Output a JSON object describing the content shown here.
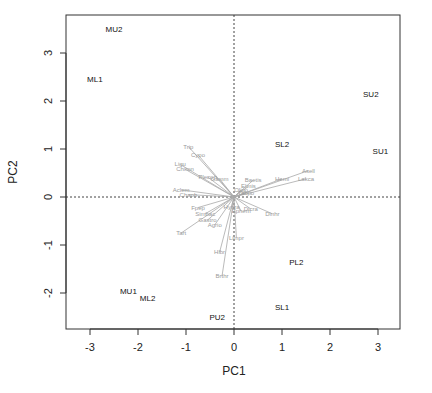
{
  "chart_data": {
    "type": "scatter",
    "subtype": "pca-biplot",
    "title": "",
    "xlabel": "PC1",
    "ylabel": "PC2",
    "xlim": [
      -3.5,
      3.45
    ],
    "ylim": [
      -2.75,
      3.8
    ],
    "xticks": [
      -3,
      -2,
      -1,
      0,
      1,
      2,
      3
    ],
    "yticks": [
      -2,
      -1,
      0,
      1,
      2,
      3
    ],
    "grid": false,
    "reference_lines": {
      "x": 0,
      "y": 0,
      "style": "dotted"
    },
    "observations": [
      {
        "label": "MU2",
        "x": -2.5,
        "y": 3.5
      },
      {
        "label": "ML1",
        "x": -2.9,
        "y": 2.45
      },
      {
        "label": "SU2",
        "x": 2.85,
        "y": 2.15
      },
      {
        "label": "SL2",
        "x": 1.0,
        "y": 1.1
      },
      {
        "label": "SU1",
        "x": 3.05,
        "y": 0.95
      },
      {
        "label": "PL2",
        "x": 1.3,
        "y": -1.35
      },
      {
        "label": "MU1",
        "x": -2.2,
        "y": -1.95
      },
      {
        "label": "ML2",
        "x": -1.8,
        "y": -2.1
      },
      {
        "label": "SL1",
        "x": 1.0,
        "y": -2.3
      },
      {
        "label": "PU2",
        "x": -0.35,
        "y": -2.5
      }
    ],
    "variables": [
      {
        "label": "Trip",
        "x": -0.95,
        "y": 1.05
      },
      {
        "label": "Cypo",
        "x": -0.75,
        "y": 0.88
      },
      {
        "label": "Ligu",
        "x": -1.12,
        "y": 0.68
      },
      {
        "label": "Chiron",
        "x": -1.02,
        "y": 0.58
      },
      {
        "label": "Plecop",
        "x": -0.55,
        "y": 0.42
      },
      {
        "label": "Gamm",
        "x": -0.3,
        "y": 0.38
      },
      {
        "label": "Aclem",
        "x": -1.1,
        "y": 0.15
      },
      {
        "label": "Chaob",
        "x": -0.95,
        "y": 0.05
      },
      {
        "label": "Asell",
        "x": 1.55,
        "y": 0.55
      },
      {
        "label": "Hemi",
        "x": 1.0,
        "y": 0.38
      },
      {
        "label": "Lakca",
        "x": 1.5,
        "y": 0.38
      },
      {
        "label": "Baetis",
        "x": 0.4,
        "y": 0.35
      },
      {
        "label": "Elmis",
        "x": 0.3,
        "y": 0.22
      },
      {
        "label": "Oligo",
        "x": 0.15,
        "y": 0.15
      },
      {
        "label": "Tabpo",
        "x": 0.25,
        "y": 0.08
      },
      {
        "label": "Fpep",
        "x": -0.75,
        "y": -0.22
      },
      {
        "label": "Simbac",
        "x": -0.6,
        "y": -0.35
      },
      {
        "label": "Gastro",
        "x": -0.55,
        "y": -0.48
      },
      {
        "label": "Agrio",
        "x": -0.4,
        "y": -0.58
      },
      {
        "label": "Tart",
        "x": -1.1,
        "y": -0.75
      },
      {
        "label": "Hydra",
        "x": -0.05,
        "y": -0.2
      },
      {
        "label": "Dicra",
        "x": 0.35,
        "y": -0.25
      },
      {
        "label": "Ephem",
        "x": 0.15,
        "y": -0.3
      },
      {
        "label": "Dinhr",
        "x": 0.8,
        "y": -0.35
      },
      {
        "label": "Limpr",
        "x": 0.05,
        "y": -0.85
      },
      {
        "label": "Hlbr",
        "x": -0.3,
        "y": -1.15
      },
      {
        "label": "Brthr",
        "x": -0.25,
        "y": -1.65
      }
    ]
  },
  "colors": {
    "observation_text": "#111111",
    "variable_arrow": "#a8a8a8",
    "variable_text": "#9a9a9a",
    "frame": "#333333"
  }
}
